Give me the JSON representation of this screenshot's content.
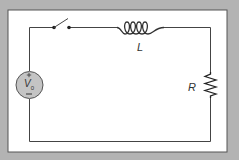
{
  "diagram": {
    "colors": {
      "background": "#b3b3b3",
      "panel": "#ffffff",
      "panel_border": "#555555",
      "wire": "#444444",
      "source_fill": "#c4c4c4",
      "text": "#333333"
    },
    "components": {
      "switch": {
        "type": "switch",
        "state": "open"
      },
      "inductor": {
        "type": "inductor",
        "label": "L",
        "turns": 4
      },
      "resistor": {
        "type": "resistor",
        "label": "R"
      },
      "source": {
        "type": "voltage-source",
        "label": "V",
        "subscript": "0",
        "plus": "+",
        "minus": "−"
      }
    }
  }
}
